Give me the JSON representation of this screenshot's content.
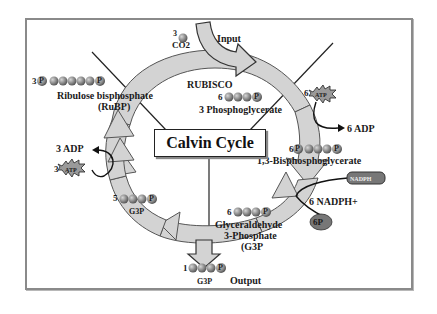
{
  "title": "Calvin Cycle",
  "colors": {
    "frame_border": "#8a8a8a",
    "cycle_arrow_fill": "#d3d3d3",
    "cycle_arrow_stroke": "#555555",
    "molecule_ball": "#8c8c8c",
    "nadph_badge": "#6a6a6a",
    "text": "#1a1a1a"
  },
  "input": {
    "label": "Input",
    "count": "3",
    "molecule": "CO2"
  },
  "output": {
    "label": "Output",
    "count": "1",
    "molecule": "G3P"
  },
  "enzyme": {
    "label": "RUBISCO"
  },
  "molecules": [
    {
      "id": "rubp",
      "count": "3",
      "name": "Ribulose bisphosphate",
      "abbr": "(RuBP)"
    },
    {
      "id": "3pga",
      "count": "6",
      "name": "3 Phosphoglycerate"
    },
    {
      "id": "bpg",
      "count": "6",
      "name": "1,3-Bisphosphoglycerate"
    },
    {
      "id": "g3p",
      "count": "6",
      "name": "Glyceraldehyde",
      "name2": "3-Phosphate",
      "abbr": "(G3P"
    },
    {
      "id": "g3p5",
      "count": "5",
      "name": "G3P"
    }
  ],
  "cofactors": {
    "atp_right": {
      "count": "6",
      "label": "ATP"
    },
    "adp_right": {
      "label": "6 ADP"
    },
    "nadph": {
      "label": "NADPH"
    },
    "nadp_plus": {
      "label": "6 NADPH+"
    },
    "pi": {
      "label": "6P",
      "sub": "i"
    },
    "adp_left": {
      "label": "3 ADP"
    },
    "atp_left": {
      "count": "3",
      "label": "ATP"
    }
  },
  "phosphate_symbol": "P"
}
